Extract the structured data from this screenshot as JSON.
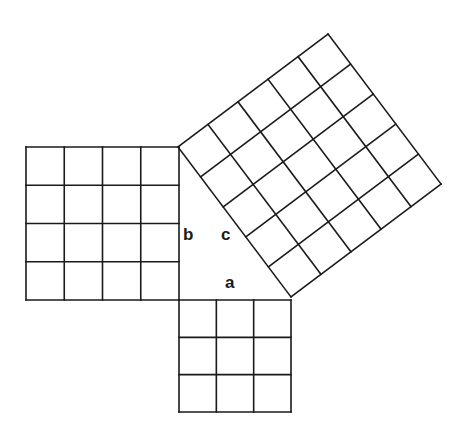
{
  "diagram": {
    "labels": {
      "a": "a",
      "b": "b",
      "c": "c"
    },
    "triangle": {
      "right_angle_vertex": [
        179,
        300
      ],
      "top_vertex": [
        178,
        147
      ],
      "right_vertex": [
        291,
        297
      ]
    },
    "squares": [
      {
        "name": "square-b",
        "side_units": 4,
        "cells": 16
      },
      {
        "name": "square-a",
        "side_units": 3,
        "cells": 9
      },
      {
        "name": "square-c",
        "side_units": 5,
        "cells": 25
      }
    ],
    "line_color": "#1a1a1a",
    "background": "#ffffff"
  }
}
